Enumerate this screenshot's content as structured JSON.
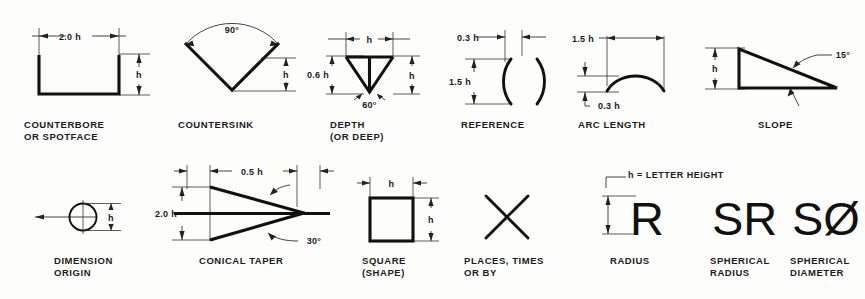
{
  "sheet": {
    "background_color": "#fdfdfb",
    "line_color": "#111111",
    "text_color": "#1b1b1b",
    "note": "h = LETTER HEIGHT"
  },
  "symbols": [
    {
      "id": "counterbore",
      "caption": "COUNTERBORE\nOR SPOTFACE",
      "dims": {
        "width": "2.0 h",
        "height": "h"
      }
    },
    {
      "id": "countersink",
      "caption": "COUNTERSINK",
      "dims": {
        "angle": "90°",
        "height": "h"
      }
    },
    {
      "id": "depth",
      "caption": "DEPTH\n(OR DEEP)",
      "dims": {
        "width": "h",
        "height": "h",
        "arrow_depth": "0.6 h",
        "angle": "60°"
      }
    },
    {
      "id": "reference",
      "caption": "REFERENCE",
      "dims": {
        "gap": "0.3 h",
        "height": "1.5 h"
      }
    },
    {
      "id": "arc-length",
      "caption": "ARC LENGTH",
      "dims": {
        "width": "1.5 h",
        "rise": "0.3 h"
      }
    },
    {
      "id": "slope",
      "caption": "SLOPE",
      "dims": {
        "height": "h",
        "angle": "15°"
      }
    },
    {
      "id": "dimension-origin",
      "caption": "DIMENSION\nORIGIN",
      "dims": {
        "diameter": "h"
      }
    },
    {
      "id": "conical-taper",
      "caption": "CONICAL TAPER",
      "dims": {
        "height": "2.0 h",
        "left_offset": "0.5 h",
        "right_offset": "0.5 h",
        "angle": "30°"
      }
    },
    {
      "id": "square-shape",
      "caption": "SQUARE\n(SHAPE)",
      "dims": {
        "width": "h",
        "height": "h"
      }
    },
    {
      "id": "places-times",
      "caption": "PLACES, TIMES\nOR BY",
      "glyph": "X",
      "dims": {}
    },
    {
      "id": "radius",
      "caption": "RADIUS",
      "glyph": "R",
      "dims": {
        "height": "h"
      }
    },
    {
      "id": "spherical-radius",
      "caption": "SPHERICAL\nRADIUS",
      "glyph": "SR",
      "dims": {}
    },
    {
      "id": "spherical-diameter",
      "caption": "SPHERICAL\nDIAMETER",
      "glyph": "SØ",
      "dims": {}
    }
  ]
}
